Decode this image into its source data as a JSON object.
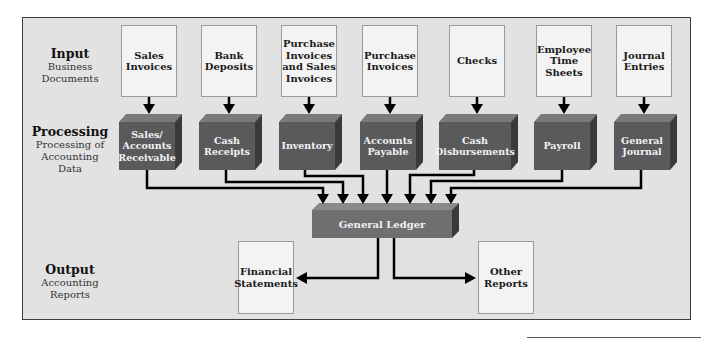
{
  "diagram": {
    "type": "accounting-information-flow",
    "rows": [
      {
        "title": "Input",
        "subtitle_lines": [
          "Business",
          "Documents"
        ]
      },
      {
        "title": "Processing",
        "subtitle_lines": [
          "Processing of",
          "Accounting",
          "Data"
        ]
      },
      {
        "title": "Output",
        "subtitle_lines": [
          "Accounting",
          "Reports"
        ]
      }
    ],
    "input_documents": [
      {
        "label_lines": [
          "Sales",
          "Invoices"
        ]
      },
      {
        "label_lines": [
          "Bank",
          "Deposits"
        ]
      },
      {
        "label_lines": [
          "Purchase",
          "Invoices",
          "and Sales",
          "Invoices"
        ]
      },
      {
        "label_lines": [
          "Purchase",
          "Invoices"
        ]
      },
      {
        "label_lines": [
          "Checks"
        ]
      },
      {
        "label_lines": [
          "Employee",
          "Time",
          "Sheets"
        ]
      },
      {
        "label_lines": [
          "Journal",
          "Entries"
        ]
      }
    ],
    "journals": [
      {
        "label_lines": [
          "Sales/",
          "Accounts",
          "Receivable"
        ]
      },
      {
        "label_lines": [
          "Cash",
          "Receipts"
        ]
      },
      {
        "label_lines": [
          "Inventory"
        ]
      },
      {
        "label_lines": [
          "Accounts",
          "Payable"
        ]
      },
      {
        "label_lines": [
          "Cash",
          "Disbursements"
        ]
      },
      {
        "label_lines": [
          "Payroll"
        ]
      },
      {
        "label_lines": [
          "General",
          "Journal"
        ]
      }
    ],
    "ledger": {
      "label": "General Ledger"
    },
    "outputs": [
      {
        "label_lines": [
          "Financial",
          "Statements"
        ]
      },
      {
        "label_lines": [
          "Other",
          "Reports"
        ]
      }
    ],
    "colors": {
      "background": "#e2e2e2",
      "frame_border": "#3c3c3c",
      "document_fill": "#f3f3f3",
      "cube_front": "#5a5a5c",
      "cube_top": "#7a7a7c",
      "cube_side": "#3a3a3c",
      "ledger_front": "#6f6f71",
      "arrow": "#000000"
    }
  }
}
